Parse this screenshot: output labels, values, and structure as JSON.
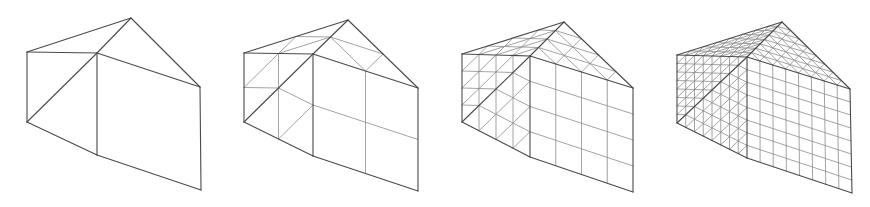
{
  "figure": {
    "colors": {
      "background": "#ffffff",
      "outer_edge": "#4a4a4a",
      "inner_edge": "#8c8c8c"
    },
    "faces": {
      "triangles": [
        [
          "A",
          "B",
          "D"
        ],
        [
          "D",
          "B",
          "E"
        ],
        [
          "A",
          "C",
          "B"
        ],
        [
          "B",
          "C",
          "F"
        ]
      ],
      "quads": [
        [
          "B",
          "F",
          "G",
          "E"
        ]
      ]
    },
    "meshes": [
      {
        "name": "mesh-level-1",
        "subdivisions": 1,
        "vertices": {
          "A": [
            27,
            52
          ],
          "B": [
            97,
            53
          ],
          "C": [
            131,
            18
          ],
          "D": [
            27,
            122
          ],
          "E": [
            97,
            155
          ],
          "F": [
            200,
            87
          ],
          "G": [
            201,
            190
          ]
        }
      },
      {
        "name": "mesh-level-2",
        "subdivisions": 2,
        "vertices": {
          "A": [
            244,
            53
          ],
          "B": [
            313,
            54
          ],
          "C": [
            348,
            20
          ],
          "D": [
            244,
            122
          ],
          "E": [
            313,
            156
          ],
          "F": [
            418,
            88
          ],
          "G": [
            418,
            191
          ]
        }
      },
      {
        "name": "mesh-level-3",
        "subdivisions": 4,
        "vertices": {
          "A": [
            462,
            54
          ],
          "B": [
            530,
            56
          ],
          "C": [
            564,
            22
          ],
          "D": [
            462,
            122
          ],
          "E": [
            530,
            157
          ],
          "F": [
            633,
            88
          ],
          "G": [
            633,
            192
          ]
        }
      },
      {
        "name": "mesh-level-4",
        "subdivisions": 8,
        "vertices": {
          "A": [
            677,
            55
          ],
          "B": [
            747,
            57
          ],
          "C": [
            782,
            22
          ],
          "D": [
            677,
            123
          ],
          "E": [
            747,
            158
          ],
          "F": [
            850,
            89
          ],
          "G": [
            852,
            193
          ]
        }
      }
    ]
  }
}
